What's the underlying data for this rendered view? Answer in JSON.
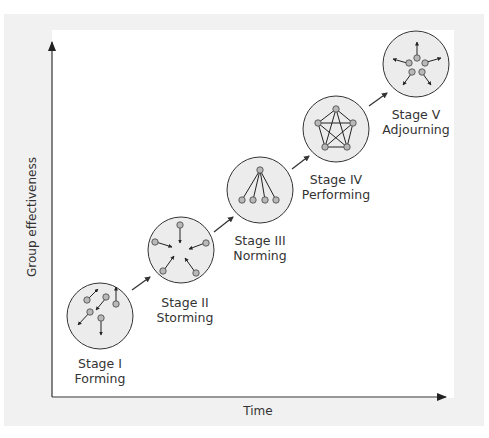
{
  "diagram": {
    "title": "",
    "axes": {
      "x_label": "Time",
      "y_label": "Group effectiveness"
    },
    "stages": [
      {
        "name": "Stage I",
        "label": "Forming",
        "pattern": "scattered-arrows"
      },
      {
        "name": "Stage II",
        "label": "Storming",
        "pattern": "arrows-converging-inward"
      },
      {
        "name": "Stage III",
        "label": "Norming",
        "pattern": "hierarchy-one-to-four"
      },
      {
        "name": "Stage IV",
        "label": "Performing",
        "pattern": "fully-connected-pentagon"
      },
      {
        "name": "Stage V",
        "label": "Adjourning",
        "pattern": "arrows-diverging-outward"
      }
    ],
    "colors": {
      "panel_bg": "#f1f1f1",
      "circle_fill": "#ececec",
      "node_fill": "#b8b8b8",
      "stroke": "#333333"
    }
  }
}
